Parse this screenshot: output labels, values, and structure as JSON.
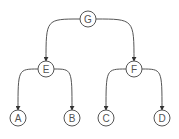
{
  "diagram": {
    "type": "binary-tree",
    "colors": {
      "stroke": "#555555",
      "fill": "#ffffff",
      "text": "#555555"
    },
    "nodes": [
      {
        "id": "G",
        "label": "G",
        "x": 88,
        "y": 19
      },
      {
        "id": "E",
        "label": "E",
        "x": 46,
        "y": 69
      },
      {
        "id": "F",
        "label": "F",
        "x": 134,
        "y": 69
      },
      {
        "id": "A",
        "label": "A",
        "x": 18,
        "y": 118
      },
      {
        "id": "B",
        "label": "B",
        "x": 72,
        "y": 118
      },
      {
        "id": "C",
        "label": "C",
        "x": 106,
        "y": 118
      },
      {
        "id": "D",
        "label": "D",
        "x": 162,
        "y": 118
      }
    ],
    "edges": [
      {
        "from": "G",
        "to": "E"
      },
      {
        "from": "G",
        "to": "F"
      },
      {
        "from": "E",
        "to": "A"
      },
      {
        "from": "E",
        "to": "B"
      },
      {
        "from": "F",
        "to": "C"
      },
      {
        "from": "F",
        "to": "D"
      }
    ]
  }
}
